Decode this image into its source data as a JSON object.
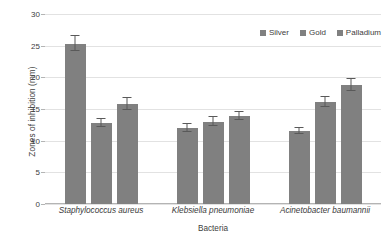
{
  "chart_data": {
    "type": "bar",
    "title": "",
    "xlabel": "Bacteria",
    "ylabel": "Zones of inhibition (mm)",
    "ylim": [
      0,
      30
    ],
    "yticks": [
      0,
      5,
      10,
      15,
      20,
      25,
      30
    ],
    "ytick_labels": [
      "0",
      "5",
      "10",
      "15",
      "20",
      "25",
      "30"
    ],
    "grid": "horizontal",
    "legend_position": "top-right",
    "categories": [
      "Staphylococcus aureus",
      "Klebsiella pneumoniae",
      "Acinetobacter baumannii"
    ],
    "series": [
      {
        "name": "Silver",
        "color": "#808080",
        "values": [
          25.3,
          12.0,
          11.5
        ],
        "errors": [
          1.2,
          0.6,
          0.5
        ]
      },
      {
        "name": "Gold",
        "color": "#808080",
        "values": [
          12.8,
          13.0,
          16.1
        ],
        "errors": [
          0.6,
          0.7,
          0.8
        ]
      },
      {
        "name": "Palladium",
        "color": "#808080",
        "values": [
          15.8,
          13.9,
          18.8
        ],
        "errors": [
          0.9,
          0.6,
          0.9
        ]
      }
    ],
    "colors": {
      "bar": "#808080",
      "error_bar": "#595959",
      "gridline": "#e2e2e2",
      "axis": "#b4b4b4",
      "text": "#404040"
    }
  }
}
